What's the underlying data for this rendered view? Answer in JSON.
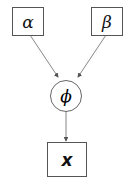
{
  "diagram": {
    "type": "graphical-model",
    "nodes": [
      {
        "id": "alpha",
        "label": "α",
        "shape": "box"
      },
      {
        "id": "beta",
        "label": "β",
        "shape": "box"
      },
      {
        "id": "phi",
        "label": "ϕ",
        "shape": "circle"
      },
      {
        "id": "x",
        "label": "x",
        "shape": "box"
      }
    ],
    "edges": [
      {
        "from": "alpha",
        "to": "phi"
      },
      {
        "from": "beta",
        "to": "phi"
      },
      {
        "from": "phi",
        "to": "x"
      }
    ],
    "colors": {
      "stroke": "#555555",
      "text": "#111111",
      "background": "#ffffff"
    }
  }
}
